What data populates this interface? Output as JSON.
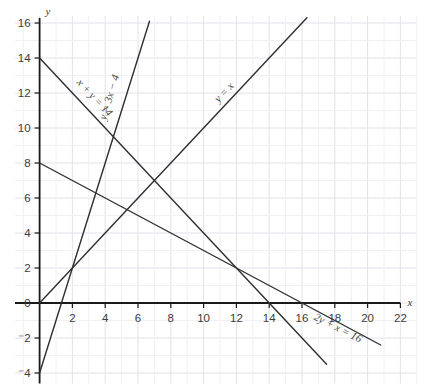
{
  "chart_data": {
    "type": "line",
    "title": "",
    "xlabel": "x",
    "ylabel": "y",
    "xlim": [
      -1.5,
      23
    ],
    "ylim": [
      -4.6,
      16.4
    ],
    "xticks": [
      2,
      4,
      6,
      8,
      10,
      12,
      14,
      16,
      18,
      20,
      22
    ],
    "yticks": [
      -4,
      -2,
      0,
      2,
      4,
      6,
      8,
      10,
      12,
      14,
      16
    ],
    "ytick_labels": [
      "⁻4",
      "⁻2",
      "0",
      "2",
      "4",
      "6",
      "8",
      "10",
      "12",
      "14",
      "16"
    ],
    "grid": true,
    "grid_color": "#e2e2ea",
    "axis_color": "#1a1a1a",
    "line_color": "#2f2f2f",
    "legend": "inline-labels",
    "series": [
      {
        "name": "x + y = 14",
        "label": "x + y = 14",
        "equation": "x + y = 14",
        "slope": -1,
        "intercept": 14,
        "x_from": 0,
        "x_to": 17.5,
        "label_x": 3.2,
        "label_y": 11.6,
        "label_rotation": 47
      },
      {
        "name": "y = 3x - 4",
        "label": "y = 3x − 4",
        "equation": "y = 3x - 4",
        "slope": 3,
        "intercept": -4,
        "x_from": 0,
        "x_to": 6.7,
        "label_x": 4.45,
        "label_y": 11.7,
        "label_rotation": -73
      },
      {
        "name": "y = x",
        "label": "y = x",
        "equation": "y = x",
        "slope": 1,
        "intercept": 0,
        "x_from": 0,
        "x_to": 16.3,
        "label_x": 11.4,
        "label_y": 11.9,
        "label_rotation": -47
      },
      {
        "name": "2y + x = 16",
        "label": "2y + x = 16",
        "equation": "2y + x = 16",
        "slope": -0.5,
        "intercept": 8,
        "x_from": 0,
        "x_to": 20.8,
        "label_x": 18.1,
        "label_y": -1.6,
        "label_rotation": 27
      }
    ],
    "intersections": [
      {
        "x": 2,
        "y": 2,
        "lines": [
          "y = x",
          "y = 3x - 4"
        ]
      },
      {
        "x": 12,
        "y": 2,
        "lines": [
          "x + y = 14",
          "2y + x = 16"
        ]
      },
      {
        "x": 7,
        "y": 7,
        "lines": [
          "x + y = 14",
          "y = x"
        ]
      },
      {
        "x": 4.5,
        "y": 9.5,
        "lines": [
          "x + y = 14",
          "y = 3x - 4"
        ]
      }
    ]
  }
}
